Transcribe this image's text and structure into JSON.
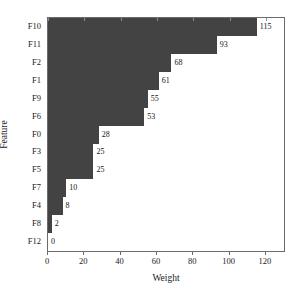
{
  "chart_data": {
    "type": "bar",
    "orientation": "horizontal",
    "title": "",
    "xlabel": "Weight",
    "ylabel": "Feature",
    "categories": [
      "F10",
      "F11",
      "F2",
      "F1",
      "F9",
      "F6",
      "F0",
      "F3",
      "F5",
      "F7",
      "F4",
      "F8",
      "F12"
    ],
    "values": [
      115,
      93,
      68,
      61,
      55,
      53,
      28,
      25,
      25,
      10,
      8,
      2,
      0
    ],
    "value_labels": [
      "115",
      "93",
      "68",
      "61",
      "55",
      "53",
      "28",
      "25",
      "25",
      "10",
      "8",
      "2",
      "0"
    ],
    "xlim": [
      0,
      130
    ],
    "xticks": [
      0,
      20,
      40,
      60,
      80,
      100,
      120
    ],
    "xtick_labels": [
      "0",
      "20",
      "40",
      "60",
      "80",
      "100",
      "120"
    ],
    "grid": false,
    "legend": null,
    "bar_color": "#434343",
    "axis_color": "#6b6b6b",
    "background_color": "#ffffff"
  }
}
